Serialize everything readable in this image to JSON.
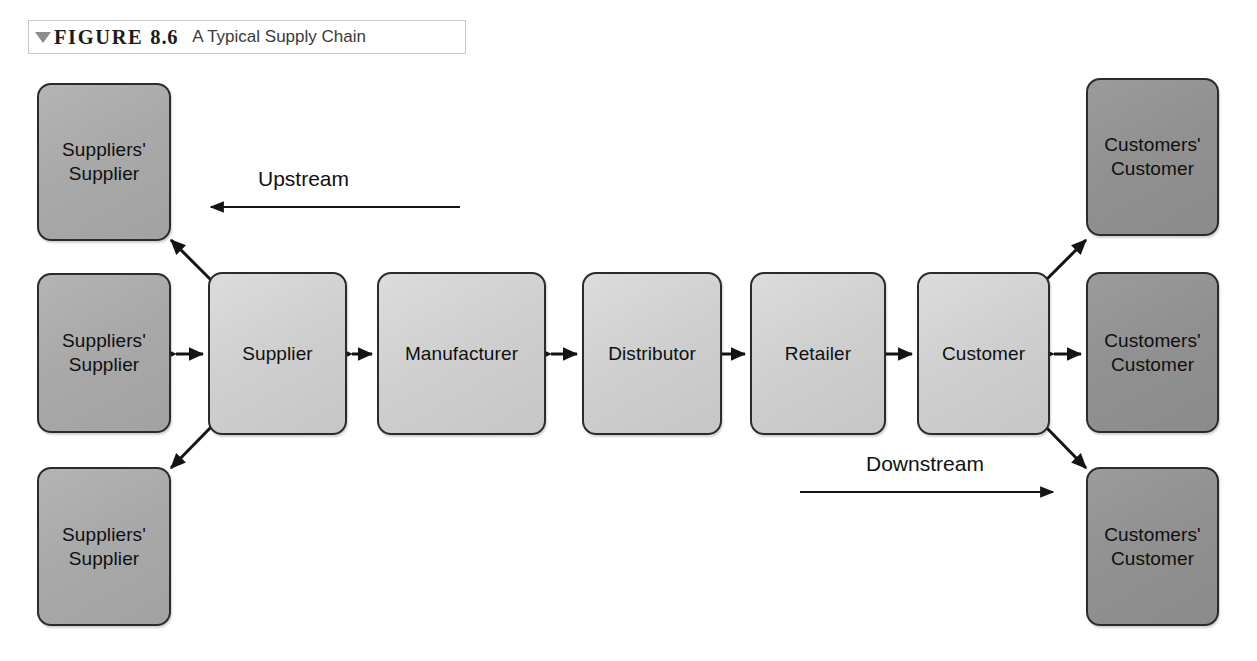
{
  "figure": {
    "marker": "triangle-down",
    "label": "FIGURE",
    "number": "8.6",
    "title": "A Typical Supply Chain"
  },
  "colors": {
    "outer_supplier_fill": "#a9a9a9",
    "outer_customer_fill": "#919191",
    "chain_fill": "#cfcfcf",
    "node_border": "#2b2b2b",
    "arrow": "#141414",
    "caption_border": "#c9c9c9",
    "caption_triangle": "#8c8c8c",
    "page_background": "#ffffff"
  },
  "diagram": {
    "type": "supply-chain-flow",
    "nodes": [
      {
        "id": "suppliers-supplier-top",
        "label": "Suppliers'\nSupplier",
        "tier": "outer-supplier",
        "column": 0,
        "row": "top"
      },
      {
        "id": "suppliers-supplier-middle",
        "label": "Suppliers'\nSupplier",
        "tier": "outer-supplier",
        "column": 0,
        "row": "middle"
      },
      {
        "id": "suppliers-supplier-bottom",
        "label": "Suppliers'\nSupplier",
        "tier": "outer-supplier",
        "column": 0,
        "row": "bottom"
      },
      {
        "id": "supplier",
        "label": "Supplier",
        "tier": "chain",
        "column": 1,
        "row": "middle"
      },
      {
        "id": "manufacturer",
        "label": "Manufacturer",
        "tier": "chain",
        "column": 2,
        "row": "middle"
      },
      {
        "id": "distributor",
        "label": "Distributor",
        "tier": "chain",
        "column": 3,
        "row": "middle"
      },
      {
        "id": "retailer",
        "label": "Retailer",
        "tier": "chain",
        "column": 4,
        "row": "middle"
      },
      {
        "id": "customer",
        "label": "Customer",
        "tier": "chain",
        "column": 5,
        "row": "middle"
      },
      {
        "id": "customers-customer-top",
        "label": "Customers'\nCustomer",
        "tier": "outer-customer",
        "column": 6,
        "row": "top"
      },
      {
        "id": "customers-customer-middle",
        "label": "Customers'\nCustomer",
        "tier": "outer-customer",
        "column": 6,
        "row": "middle"
      },
      {
        "id": "customers-customer-bottom",
        "label": "Customers'\nCustomer",
        "tier": "outer-customer",
        "column": 6,
        "row": "bottom"
      }
    ],
    "connections": [
      {
        "from": "suppliers-supplier-top",
        "to": "supplier",
        "style": "double-headed",
        "orientation": "diagonal"
      },
      {
        "from": "suppliers-supplier-middle",
        "to": "supplier",
        "style": "double-headed",
        "orientation": "horizontal"
      },
      {
        "from": "suppliers-supplier-bottom",
        "to": "supplier",
        "style": "double-headed",
        "orientation": "diagonal"
      },
      {
        "from": "supplier",
        "to": "manufacturer",
        "style": "double-headed",
        "orientation": "horizontal"
      },
      {
        "from": "manufacturer",
        "to": "distributor",
        "style": "double-headed",
        "orientation": "horizontal"
      },
      {
        "from": "distributor",
        "to": "retailer",
        "style": "double-headed",
        "orientation": "horizontal"
      },
      {
        "from": "retailer",
        "to": "customer",
        "style": "double-headed",
        "orientation": "horizontal"
      },
      {
        "from": "customer",
        "to": "customers-customer-top",
        "style": "double-headed",
        "orientation": "diagonal"
      },
      {
        "from": "customer",
        "to": "customers-customer-middle",
        "style": "double-headed",
        "orientation": "horizontal"
      },
      {
        "from": "customer",
        "to": "customers-customer-bottom",
        "style": "double-headed",
        "orientation": "diagonal"
      }
    ],
    "flow_labels": [
      {
        "id": "upstream",
        "text": "Upstream",
        "arrow_direction": "left"
      },
      {
        "id": "downstream",
        "text": "Downstream",
        "arrow_direction": "right"
      }
    ]
  }
}
